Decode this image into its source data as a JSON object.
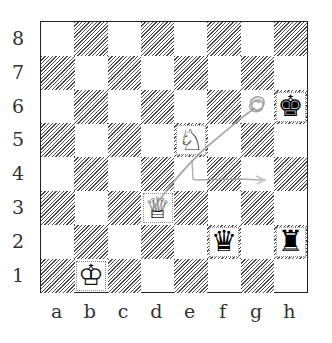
{
  "diagram": {
    "type": "chess-position",
    "ranks": [
      "8",
      "7",
      "6",
      "5",
      "4",
      "3",
      "2",
      "1"
    ],
    "files": [
      "a",
      "b",
      "c",
      "d",
      "e",
      "f",
      "g",
      "h"
    ],
    "colors": {
      "dark_square_hatch": "#4a4a4a",
      "light_square": "#ffffff",
      "border": "#222222",
      "annotation": "#a8a8a8"
    },
    "pieces": [
      {
        "square": "b1",
        "color": "white",
        "type": "king",
        "glyph": "♔"
      },
      {
        "square": "d3",
        "color": "white",
        "type": "queen",
        "glyph": "♕"
      },
      {
        "square": "e5",
        "color": "white",
        "type": "knight",
        "glyph": "♘"
      },
      {
        "square": "h6",
        "color": "black",
        "type": "king",
        "glyph": "♚"
      },
      {
        "square": "f2",
        "color": "black",
        "type": "queen",
        "glyph": "♛"
      },
      {
        "square": "h2",
        "color": "black",
        "type": "rook",
        "glyph": "♜"
      }
    ],
    "annotations": [
      {
        "kind": "pencil-line",
        "from": "d3",
        "to": "g6",
        "note": "diagonal stroke ending in scribble on g6"
      },
      {
        "kind": "pencil-line",
        "from": "e5",
        "to": "g4",
        "note": "vertical stroke down then horizontal to g4"
      }
    ]
  }
}
